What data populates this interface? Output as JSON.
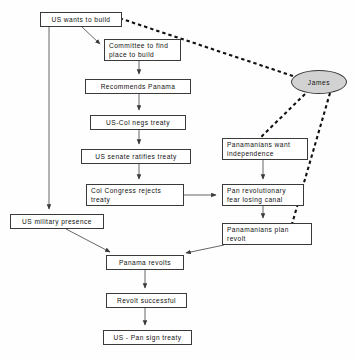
{
  "diagram": {
    "background_color": "#fefefe",
    "node_fill": "#ffffff",
    "node_border_color": "#3a3a3a",
    "ellipse_fill": "#d2d2d2",
    "edge_color": "#444444",
    "dashed_edge_color": "#111111"
  },
  "nodes": {
    "us_wants_build": {
      "label": "US wants to build",
      "shape": "rect",
      "x": 40,
      "y": 12,
      "w": 82,
      "h": 15
    },
    "committee": {
      "label": "Committee to find\nplace to build",
      "shape": "rect",
      "x": 104,
      "y": 39,
      "w": 77,
      "h": 22
    },
    "recommends_panama": {
      "label": "Recommends Panama",
      "shape": "rect",
      "x": 85,
      "y": 79,
      "w": 106,
      "h": 15
    },
    "us_col_negs": {
      "label": "US-Col negs treaty",
      "shape": "rect",
      "x": 90,
      "y": 115,
      "w": 96,
      "h": 15
    },
    "senate_ratifies": {
      "label": "US senate ratifies treaty",
      "shape": "rect",
      "x": 81,
      "y": 149,
      "w": 110,
      "h": 15
    },
    "col_congress_rejects": {
      "label": "Col Congress rejects\ntreaty",
      "shape": "rect",
      "x": 86,
      "y": 184,
      "w": 98,
      "h": 22
    },
    "us_military_presence": {
      "label": "US military presence",
      "shape": "rect",
      "x": 10,
      "y": 214,
      "w": 94,
      "h": 15
    },
    "panamanians_want_indep": {
      "label": "Panamanians want\nindependence",
      "shape": "rect",
      "x": 222,
      "y": 138,
      "w": 86,
      "h": 22
    },
    "pan_revolutionary": {
      "label": "Pan revolutionary\nfear losing canal",
      "shape": "rect",
      "x": 222,
      "y": 184,
      "w": 82,
      "h": 22
    },
    "panamanians_plan_revolt": {
      "label": "Panamanians plan\nrevolt",
      "shape": "rect",
      "x": 222,
      "y": 223,
      "w": 90,
      "h": 22
    },
    "panama_revolts": {
      "label": "Panama revolts",
      "shape": "rect",
      "x": 106,
      "y": 255,
      "w": 78,
      "h": 15
    },
    "revolt_successful": {
      "label": "Revolt successful",
      "shape": "rect",
      "x": 106,
      "y": 293,
      "w": 81,
      "h": 15
    },
    "us_pan_sign_treaty": {
      "label": "US - Pan sign treaty",
      "shape": "rect",
      "x": 103,
      "y": 330,
      "w": 89,
      "h": 15
    },
    "james": {
      "label": "James",
      "shape": "ellipse",
      "x": 291,
      "y": 70,
      "w": 56,
      "h": 24
    }
  },
  "edges": [
    {
      "from": "us_wants_build",
      "to": "committee",
      "style": "solid",
      "arrow": true
    },
    {
      "from": "us_wants_build",
      "to": "us_military_presence",
      "style": "solid",
      "arrow": true
    },
    {
      "from": "committee",
      "to": "recommends_panama",
      "style": "solid",
      "arrow": true
    },
    {
      "from": "recommends_panama",
      "to": "us_col_negs",
      "style": "solid",
      "arrow": true
    },
    {
      "from": "us_col_negs",
      "to": "senate_ratifies",
      "style": "solid",
      "arrow": true
    },
    {
      "from": "senate_ratifies",
      "to": "col_congress_rejects",
      "style": "solid",
      "arrow": true
    },
    {
      "from": "col_congress_rejects",
      "to": "pan_revolutionary",
      "style": "solid",
      "arrow": true
    },
    {
      "from": "panamanians_want_indep",
      "to": "pan_revolutionary",
      "style": "solid",
      "arrow": true
    },
    {
      "from": "pan_revolutionary",
      "to": "panamanians_plan_revolt",
      "style": "solid",
      "arrow": true
    },
    {
      "from": "us_military_presence",
      "to": "panama_revolts",
      "style": "solid",
      "arrow": true
    },
    {
      "from": "panamanians_plan_revolt",
      "to": "panama_revolts",
      "style": "solid",
      "arrow": true
    },
    {
      "from": "panama_revolts",
      "to": "revolt_successful",
      "style": "solid",
      "arrow": true
    },
    {
      "from": "revolt_successful",
      "to": "us_pan_sign_treaty",
      "style": "solid",
      "arrow": true
    },
    {
      "from": "james",
      "to": "us_wants_build",
      "style": "dashed",
      "arrow": false
    },
    {
      "from": "james",
      "to": "panamanians_want_indep",
      "style": "dashed",
      "arrow": false
    },
    {
      "from": "james",
      "to": "panamanians_plan_revolt",
      "style": "dashed",
      "arrow": false
    }
  ]
}
